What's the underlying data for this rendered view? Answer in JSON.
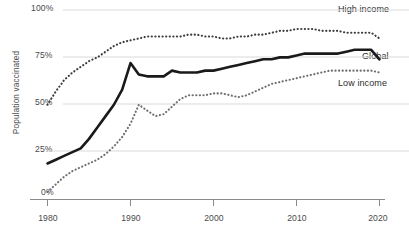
{
  "chart_data": {
    "type": "line",
    "title": "",
    "xlabel": "",
    "ylabel": "Population vaccinated",
    "xlim": [
      1980,
      2020
    ],
    "ylim": [
      0,
      100
    ],
    "grid": true,
    "legend_position": "right-inline",
    "y_ticks": [
      "0%",
      "25%",
      "50%",
      "75%",
      "100%"
    ],
    "y_tick_values": [
      0,
      25,
      50,
      75,
      100
    ],
    "x_ticks": [
      "1980",
      "1990",
      "2000",
      "2010",
      "2020"
    ],
    "x_tick_values": [
      1980,
      1990,
      2000,
      2010,
      2020
    ],
    "x": [
      1980,
      1981,
      1982,
      1983,
      1984,
      1985,
      1986,
      1987,
      1988,
      1989,
      1990,
      1991,
      1992,
      1993,
      1994,
      1995,
      1996,
      1997,
      1998,
      1999,
      2000,
      2001,
      2002,
      2003,
      2004,
      2005,
      2006,
      2007,
      2008,
      2009,
      2010,
      2011,
      2012,
      2013,
      2014,
      2015,
      2016,
      2017,
      2018,
      2019,
      2020
    ],
    "series": [
      {
        "name": "High income",
        "style": "dotted",
        "color": "#3c3c3c",
        "values": [
          50,
          57,
          63,
          67,
          70,
          73,
          75,
          78,
          81,
          83,
          84,
          85,
          86,
          86,
          86,
          86,
          86,
          87,
          87,
          86,
          86,
          85,
          85,
          86,
          86,
          87,
          87,
          88,
          89,
          89,
          90,
          90,
          90,
          89,
          89,
          89,
          88,
          88,
          88,
          88,
          85
        ]
      },
      {
        "name": "Global",
        "style": "solid",
        "color": "#1a1a1a",
        "values": [
          19,
          21,
          23,
          25,
          27,
          32,
          38,
          44,
          50,
          58,
          72,
          66,
          65,
          65,
          65,
          68,
          67,
          67,
          67,
          68,
          68,
          69,
          70,
          71,
          72,
          73,
          74,
          74,
          75,
          75,
          76,
          77,
          77,
          77,
          77,
          77,
          78,
          79,
          79,
          79,
          74
        ]
      },
      {
        "name": "Low income",
        "style": "dotted",
        "color": "#6e6e6e",
        "values": [
          4,
          8,
          12,
          15,
          17,
          19,
          21,
          24,
          28,
          33,
          40,
          50,
          47,
          44,
          45,
          49,
          53,
          55,
          55,
          55,
          56,
          56,
          55,
          54,
          55,
          57,
          59,
          61,
          62,
          63,
          64,
          65,
          66,
          67,
          68,
          68,
          68,
          68,
          68,
          68,
          67
        ]
      }
    ],
    "annotations": [
      {
        "text": "High income",
        "x": 2020,
        "y": 99
      },
      {
        "text": "Global",
        "x": 2020,
        "y": 70
      },
      {
        "text": "Low income",
        "x": 2020,
        "y": 58
      }
    ]
  },
  "axis": {
    "y_label_text": "Population vaccinated",
    "y_ticks": [
      {
        "label": "100%"
      },
      {
        "label": "75%"
      },
      {
        "label": "50%"
      },
      {
        "label": "25%"
      },
      {
        "label": "0%"
      }
    ],
    "x_ticks": [
      {
        "label": "1980"
      },
      {
        "label": "1990"
      },
      {
        "label": "2000"
      },
      {
        "label": "2010"
      },
      {
        "label": "2020"
      }
    ]
  },
  "legend": {
    "high_income": "High income",
    "global": "Global",
    "low_income": "Low income"
  },
  "colors": {
    "grid": "#d9d9d9",
    "axis": "#8a8a8a",
    "global_line": "#1a1a1a",
    "high_income_line": "#3c3c3c",
    "low_income_line": "#6e6e6e",
    "text": "#4a4a4a"
  }
}
